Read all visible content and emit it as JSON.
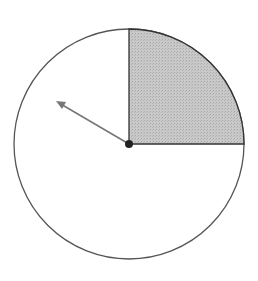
{
  "diagram": {
    "type": "spinner",
    "circle": {
      "cx": 129,
      "cy": 144,
      "r": 115,
      "stroke": "#555555",
      "fill": "#ffffff"
    },
    "shaded_sector": {
      "start_angle_deg": 0,
      "end_angle_deg": 90,
      "description": "upper-right quarter",
      "fill": "#c8c8c8",
      "stroke": "#333333"
    },
    "arrow": {
      "from": [
        129,
        144
      ],
      "to": [
        56,
        101
      ],
      "color": "#777777"
    },
    "center_dot": {
      "r": 4,
      "color": "#222222"
    }
  }
}
